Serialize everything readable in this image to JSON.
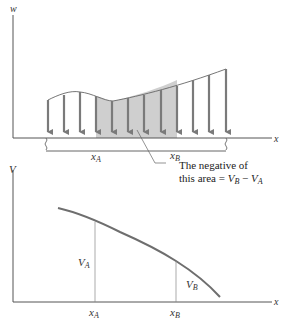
{
  "top_diagram": {
    "y_axis_label": "w",
    "x_axis_label": "x",
    "xa_label": "x",
    "xa_sub": "A",
    "xb_label": "x",
    "xb_sub": "B",
    "annotation_line1": "The negative of",
    "annotation_line2_prefix": "this area = ",
    "annotation_vb": "V",
    "annotation_vb_sub": "B",
    "annotation_minus": " − ",
    "annotation_va": "V",
    "annotation_va_sub": "A",
    "arrow_count": 12,
    "shaded_arrow_range": [
      4,
      9
    ],
    "colors": {
      "arrow": "#7a7a7a",
      "shade": "#cfcfcf",
      "axis": "#555555"
    }
  },
  "bottom_diagram": {
    "y_axis_label": "V",
    "x_axis_label": "x",
    "xa_label": "x",
    "xa_sub": "A",
    "xb_label": "x",
    "xb_sub": "B",
    "va_label": "V",
    "va_sub": "A",
    "vb_label": "V",
    "vb_sub": "B",
    "colors": {
      "curve": "#6e6e6e",
      "axis": "#555555"
    }
  }
}
